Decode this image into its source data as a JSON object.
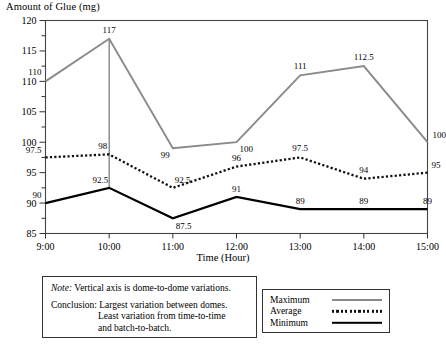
{
  "chart_data": {
    "type": "line",
    "title": "",
    "ylabel": "Amount of Glue (mg)",
    "xlabel": "Time (Hour)",
    "categories": [
      "9:00",
      "10:00",
      "11:00",
      "12:00",
      "13:00",
      "14:00",
      "15:00"
    ],
    "ylim": [
      85,
      120
    ],
    "yticks": [
      85,
      90,
      95,
      100,
      105,
      110,
      115,
      120
    ],
    "yminor_step": 2.5,
    "grid": false,
    "legend_position": "bottom-right",
    "series": [
      {
        "name": "Maximum",
        "style": "solid-gray",
        "color": "#8a8a8a",
        "values": [
          110,
          117,
          99,
          100,
          111,
          112.5,
          100
        ],
        "labels": [
          "110",
          "117",
          "99",
          "100",
          "111",
          "112.5",
          "100"
        ]
      },
      {
        "name": "Average",
        "style": "dotted-black",
        "color": "#111111",
        "values": [
          97.5,
          98,
          92.5,
          96,
          97.5,
          94,
          95
        ],
        "labels": [
          "97.5",
          "98",
          "92.5",
          "96",
          "97.5",
          "94",
          "95"
        ]
      },
      {
        "name": "Minimum",
        "style": "solid-black",
        "color": "#000000",
        "values": [
          90,
          92.5,
          87.5,
          91,
          89,
          89,
          89
        ],
        "labels": [
          "90",
          "92.5",
          "87.5",
          "91",
          "89",
          "89",
          "89"
        ]
      }
    ],
    "annotations": [
      {
        "name": "dome-range-line",
        "at_category": "10:00",
        "from_value": 117,
        "to_value": 92.5
      }
    ]
  },
  "note": {
    "label": "Note:",
    "text": "Vertical axis is dome-to-dome variations.",
    "conclusion_label": "Conclusion:",
    "conclusion_line1": "Largest variation between domes.",
    "conclusion_line2": "Least variation from time-to-time",
    "conclusion_line3": "and batch-to-batch."
  },
  "legend": {
    "items": [
      {
        "label": "Maximum"
      },
      {
        "label": "Average"
      },
      {
        "label": "Minimum"
      }
    ]
  }
}
